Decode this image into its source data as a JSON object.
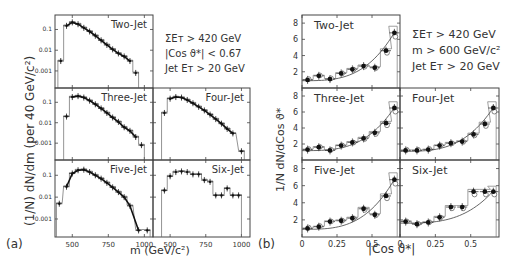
{
  "figure": {
    "panel_a_label": "(a)",
    "panel_b_label": "(b)",
    "a_ylabel": "(1/N)  dN/dm  (per 40 GeV/c²)",
    "a_xlabel": "m (GeV/c²)",
    "b_ylabel": "1/N  dN/dCos ϑ*",
    "b_xlabel": "|Cos ϑ*|",
    "a_cuts": [
      "ΣEᴛ > 420 GeV",
      "|Cos ϑ*| < 0.67",
      "Jet Eᴛ > 20 GeV"
    ],
    "b_cuts": [
      "ΣEᴛ > 420 GeV",
      "m > 600 GeV/c²",
      "Jet Eᴛ > 20 GeV"
    ],
    "a_yticks": [
      "0.1",
      "0.01",
      "0.001"
    ],
    "a_xticks": [
      "500",
      "750",
      "1000"
    ],
    "b_yticks": [
      "8",
      "6",
      "4",
      "2"
    ],
    "b_xticks": [
      "0",
      "0.25",
      "0.5"
    ],
    "panels": [
      "Two-Jet",
      "Three-Jet",
      "Four-Jet",
      "Five-Jet",
      "Six-Jet"
    ]
  },
  "chart_data": [
    {
      "type": "scatter",
      "title": "(a) Multijet mass distributions",
      "xlabel": "m (GeV/c²)",
      "ylabel": "(1/N) dN/dm (per 40 GeV/c²)",
      "yscale": "log",
      "xlim": [
        380,
        1060
      ],
      "ylim": [
        0.0001,
        0.5
      ],
      "x_ticks": [
        500,
        750,
        1000
      ],
      "y_ticks": [
        0.1,
        0.01,
        0.001
      ],
      "annotations": [
        "ΣEᴛ > 420 GeV",
        "|Cos ϑ*| < 0.67",
        "Jet Eᴛ > 20 GeV"
      ],
      "series": [
        {
          "name": "Two-Jet",
          "x": [
            420,
            460,
            500,
            540,
            580,
            620,
            660,
            700,
            740,
            780,
            820,
            860,
            900,
            940
          ],
          "y": [
            0.003,
            0.15,
            0.22,
            0.18,
            0.12,
            0.08,
            0.05,
            0.03,
            0.018,
            0.011,
            0.007,
            0.005,
            0.003,
            0.0008
          ]
        },
        {
          "name": "Three-Jet",
          "x": [
            460,
            500,
            540,
            580,
            620,
            660,
            700,
            740,
            780,
            820,
            860,
            900,
            940,
            980
          ],
          "y": [
            0.02,
            0.18,
            0.2,
            0.17,
            0.12,
            0.08,
            0.05,
            0.03,
            0.018,
            0.011,
            0.006,
            0.004,
            0.002,
            0.0008
          ]
        },
        {
          "name": "Four-Jet",
          "x": [
            460,
            500,
            540,
            580,
            620,
            660,
            700,
            740,
            780,
            820,
            860,
            900,
            940,
            1000
          ],
          "y": [
            0.03,
            0.15,
            0.18,
            0.17,
            0.13,
            0.09,
            0.06,
            0.04,
            0.025,
            0.015,
            0.009,
            0.005,
            0.003,
            0.0004
          ]
        },
        {
          "name": "Five-Jet",
          "x": [
            410,
            460,
            500,
            540,
            580,
            620,
            660,
            700,
            740,
            780,
            820,
            860,
            900,
            960,
            1020
          ],
          "y": [
            0.005,
            0.03,
            0.12,
            0.17,
            0.18,
            0.14,
            0.1,
            0.07,
            0.045,
            0.028,
            0.017,
            0.01,
            0.004,
            0.0003,
            0.0003
          ]
        },
        {
          "name": "Six-Jet",
          "x": [
            460,
            500,
            540,
            580,
            620,
            660,
            700,
            740,
            780,
            820,
            860,
            900,
            940,
            980
          ],
          "y": [
            0.02,
            0.09,
            0.14,
            0.15,
            0.14,
            0.11,
            0.11,
            0.06,
            0.05,
            0.012,
            0.012,
            0.025,
            0.012,
            0.012
          ]
        }
      ]
    },
    {
      "type": "scatter",
      "title": "(b) Angular distributions",
      "xlabel": "|Cos ϑ*|",
      "ylabel": "1/N dN/dCos ϑ*",
      "xlim": [
        0,
        0.7
      ],
      "ylim": [
        0,
        9
      ],
      "x_ticks": [
        0,
        0.25,
        0.5
      ],
      "y_ticks": [
        2,
        4,
        6,
        8
      ],
      "annotations": [
        "ΣEᴛ > 420 GeV",
        "m > 600 GeV/c²",
        "Jet Eᴛ > 20 GeV"
      ],
      "series": [
        {
          "name": "Two-Jet",
          "x": [
            0.04,
            0.12,
            0.2,
            0.28,
            0.36,
            0.44,
            0.52,
            0.6,
            0.66
          ],
          "y": [
            1.0,
            1.5,
            1.1,
            1.8,
            2.3,
            2.7,
            2.5,
            4.6,
            6.8
          ]
        },
        {
          "name": "Three-Jet",
          "x": [
            0.04,
            0.12,
            0.2,
            0.28,
            0.36,
            0.44,
            0.52,
            0.6,
            0.66
          ],
          "y": [
            1.3,
            1.6,
            1.2,
            1.8,
            2.2,
            2.7,
            3.4,
            4.6,
            6.5
          ]
        },
        {
          "name": "Four-Jet",
          "x": [
            0.04,
            0.12,
            0.2,
            0.28,
            0.36,
            0.44,
            0.52,
            0.6,
            0.66
          ],
          "y": [
            1.2,
            1.2,
            1.3,
            1.8,
            2.1,
            2.3,
            3.2,
            4.5,
            6.5
          ]
        },
        {
          "name": "Five-Jet",
          "x": [
            0.04,
            0.12,
            0.2,
            0.28,
            0.36,
            0.44,
            0.52,
            0.6,
            0.66
          ],
          "y": [
            1.0,
            1.2,
            1.8,
            1.9,
            2.2,
            3.3,
            2.6,
            4.8,
            6.7
          ]
        },
        {
          "name": "Six-Jet",
          "x": [
            0.04,
            0.12,
            0.2,
            0.28,
            0.36,
            0.44,
            0.52,
            0.6,
            0.66
          ],
          "y": [
            1.8,
            1.5,
            1.7,
            2.3,
            3.5,
            3.5,
            5.3,
            5.3,
            5.3
          ]
        }
      ]
    }
  ]
}
